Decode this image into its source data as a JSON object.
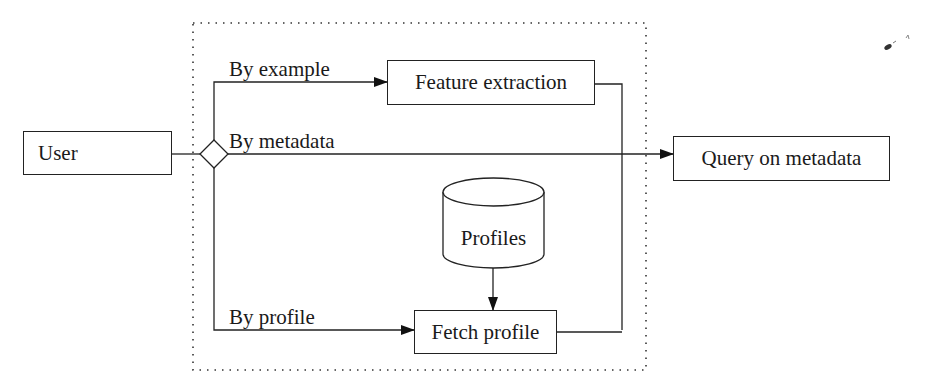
{
  "diagram": {
    "type": "flowchart",
    "nodes": {
      "user": "User",
      "feature_extraction": "Feature extraction",
      "query_on_metadata": "Query on metadata",
      "profiles": "Profiles",
      "fetch_profile": "Fetch profile"
    },
    "edge_labels": {
      "by_example": "By example",
      "by_metadata": "By metadata",
      "by_profile": "By profile"
    },
    "edges": [
      {
        "from": "User",
        "to": "decision"
      },
      {
        "from": "decision",
        "to": "Feature extraction",
        "label": "By example"
      },
      {
        "from": "decision",
        "to": "Query on metadata",
        "label": "By metadata"
      },
      {
        "from": "decision",
        "to": "Fetch profile",
        "label": "By profile"
      },
      {
        "from": "Profiles",
        "to": "Fetch profile"
      },
      {
        "from": "Feature extraction",
        "to": "Query on metadata"
      },
      {
        "from": "Fetch profile",
        "to": "Query on metadata"
      }
    ],
    "colors": {
      "stroke": "#222222",
      "background": "#ffffff"
    }
  }
}
